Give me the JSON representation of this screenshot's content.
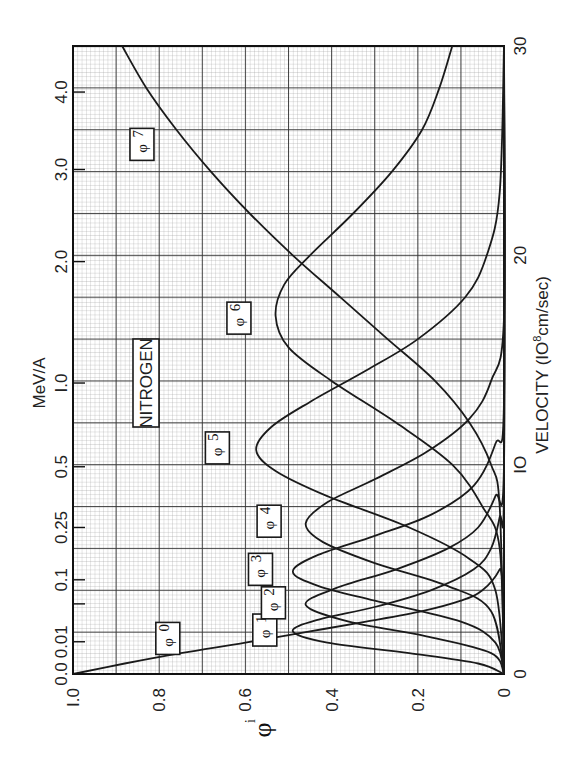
{
  "chart_data": {
    "type": "line",
    "orientation": "rotated-90-ccw",
    "title": "NITROGEN",
    "annotation": "NITROGEN",
    "xlabel": "VELOCITY (10^8 cm/sec)",
    "xlabel_parts": {
      "main": "VELOCITY  (",
      "base": "IO",
      "exp": "8",
      "rest": "cm/sec)"
    },
    "x2label": "MeV/A",
    "ylabel": "φ_i",
    "xlim": [
      0,
      30
    ],
    "ylim": [
      0,
      1.0
    ],
    "grid": true,
    "x_ticks": [
      {
        "value": 0,
        "label": "0"
      },
      {
        "value": 10,
        "label": "IO"
      },
      {
        "value": 20,
        "label": "20"
      },
      {
        "value": 30,
        "label": "30"
      }
    ],
    "y_ticks": [
      {
        "value": 0,
        "label": "0"
      },
      {
        "value": 0.2,
        "label": "0.2"
      },
      {
        "value": 0.4,
        "label": "0.4"
      },
      {
        "value": 0.6,
        "label": "0.6"
      },
      {
        "value": 0.8,
        "label": "0.8"
      },
      {
        "value": 1.0,
        "label": "I.0"
      }
    ],
    "x2_ticks": [
      {
        "velocity": 0,
        "label": "0.0"
      },
      {
        "velocity": 1.54,
        "label": "0.01"
      },
      {
        "velocity": 3.35,
        "label": ""
      },
      {
        "velocity": 4.5,
        "label": "0.1"
      },
      {
        "velocity": 7.0,
        "label": "0.25"
      },
      {
        "velocity": 9.9,
        "label": "0.5"
      },
      {
        "velocity": 13.9,
        "label": "I.0"
      },
      {
        "velocity": 19.7,
        "label": "2.0"
      },
      {
        "velocity": 24.1,
        "label": "3.0"
      },
      {
        "velocity": 27.8,
        "label": "4.0"
      }
    ],
    "series": [
      {
        "name": "φ0",
        "label_pos": {
          "v": 1.7,
          "phi": 0.78
        },
        "x": [
          0,
          0.5,
          1.0,
          1.5,
          2.0,
          2.5,
          3.0,
          3.5,
          4.0,
          5.0,
          6.0,
          30
        ],
        "values": [
          1.0,
          0.88,
          0.75,
          0.6,
          0.46,
          0.32,
          0.19,
          0.1,
          0.05,
          0.01,
          0.0,
          0.0
        ]
      },
      {
        "name": "φ1",
        "label_pos": {
          "v": 2.1,
          "phi": 0.555
        },
        "x": [
          0,
          0.5,
          1.0,
          1.5,
          2.05,
          2.6,
          3.2,
          4.0,
          5.0,
          6.0,
          7.5,
          9.0,
          30
        ],
        "values": [
          0.0,
          0.06,
          0.22,
          0.41,
          0.49,
          0.43,
          0.3,
          0.17,
          0.07,
          0.03,
          0.01,
          0.0,
          0.0
        ]
      },
      {
        "name": "φ2",
        "label_pos": {
          "v": 3.4,
          "phi": 0.535
        },
        "x": [
          0,
          1.0,
          1.8,
          2.5,
          3.3,
          4.1,
          5.0,
          6.0,
          7.0,
          8.5,
          10.0,
          30
        ],
        "values": [
          0.0,
          0.03,
          0.18,
          0.36,
          0.46,
          0.39,
          0.25,
          0.13,
          0.06,
          0.02,
          0.0,
          0.0
        ]
      },
      {
        "name": "φ3",
        "label_pos": {
          "v": 5.0,
          "phi": 0.565
        },
        "x": [
          0,
          1.5,
          2.5,
          3.5,
          4.2,
          4.9,
          5.7,
          6.6,
          7.6,
          9.0,
          11.0,
          13.0,
          30
        ],
        "values": [
          0.0,
          0.02,
          0.1,
          0.3,
          0.43,
          0.49,
          0.43,
          0.3,
          0.17,
          0.07,
          0.02,
          0.0,
          0.0
        ]
      },
      {
        "name": "φ4",
        "label_pos": {
          "v": 7.3,
          "phi": 0.545
        },
        "x": [
          0,
          3.0,
          4.2,
          5.3,
          6.3,
          7.2,
          8.2,
          9.3,
          10.6,
          12.2,
          14.0,
          17.0,
          30
        ],
        "values": [
          0.0,
          0.03,
          0.13,
          0.3,
          0.42,
          0.46,
          0.41,
          0.3,
          0.18,
          0.08,
          0.03,
          0.0,
          0.0
        ]
      },
      {
        "name": "φ5",
        "label_pos": {
          "v": 10.8,
          "phi": 0.665
        },
        "x": [
          0,
          4.0,
          5.5,
          7.0,
          8.5,
          9.7,
          10.7,
          11.8,
          13.0,
          14.5,
          16.0,
          18.0,
          20.0,
          23.0,
          30
        ],
        "values": [
          0.0,
          0.02,
          0.08,
          0.22,
          0.41,
          0.53,
          0.575,
          0.54,
          0.45,
          0.32,
          0.2,
          0.09,
          0.04,
          0.01,
          0.0
        ]
      },
      {
        "name": "φ6",
        "label_pos": {
          "v": 17.0,
          "phi": 0.615
        },
        "x": [
          0,
          6.0,
          8.0,
          10.0,
          12.0,
          14.0,
          15.6,
          17.1,
          18.6,
          20.0,
          22.0,
          24.0,
          26.0,
          28.0,
          30.0
        ],
        "values": [
          0.0,
          0.01,
          0.05,
          0.12,
          0.25,
          0.4,
          0.5,
          0.53,
          0.51,
          0.45,
          0.35,
          0.26,
          0.19,
          0.15,
          0.12
        ]
      },
      {
        "name": "φ7",
        "label_pos": {
          "v": 25.3,
          "phi": 0.84
        },
        "x": [
          0,
          8.0,
          10.0,
          12.0,
          14.0,
          16.0,
          18.0,
          20.0,
          22.0,
          24.0,
          26.0,
          28.0,
          30.0
        ],
        "values": [
          0.0,
          0.01,
          0.03,
          0.08,
          0.16,
          0.27,
          0.38,
          0.49,
          0.59,
          0.68,
          0.76,
          0.83,
          0.886
        ]
      }
    ]
  }
}
